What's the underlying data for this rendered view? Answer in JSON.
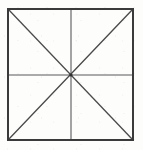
{
  "figure": {
    "title": "Square with diagonals and median lines",
    "canvas": {
      "width": 143,
      "height": 150,
      "background_color": "#fdfdfc"
    },
    "square": {
      "label": "Outer square",
      "left": 8,
      "top": 9,
      "right": 133,
      "bottom": 140,
      "width": 125,
      "height": 131,
      "stroke_color": "#3a3a3a",
      "stroke_width": 2,
      "fill": "none"
    },
    "center_point": {
      "label": "Center",
      "x": 71,
      "y": 75
    },
    "median_lines": [
      {
        "label": "Vertical median",
        "x1": 71,
        "y1": 9,
        "x2": 71,
        "y2": 140,
        "stroke_color": "#595959",
        "stroke_width": 1.1
      },
      {
        "label": "Horizontal median",
        "x1": 8,
        "y1": 75,
        "x2": 133,
        "y2": 75,
        "stroke_color": "#595959",
        "stroke_width": 1.1
      }
    ],
    "diagonal_lines": [
      {
        "label": "Diagonal top-left to bottom-right",
        "x1": 8,
        "y1": 9,
        "x2": 133,
        "y2": 140,
        "stroke_color": "#4a4a4a",
        "stroke_width": 1.3
      },
      {
        "label": "Diagonal top-right to bottom-left",
        "x1": 133,
        "y1": 9,
        "x2": 8,
        "y2": 140,
        "stroke_color": "#4a4a4a",
        "stroke_width": 1.3
      }
    ],
    "center_dot": {
      "label": "Intersection node",
      "cx": 71,
      "cy": 75,
      "r": 1.6,
      "fill_color": "#2e2e2e"
    },
    "region_count": 8
  }
}
